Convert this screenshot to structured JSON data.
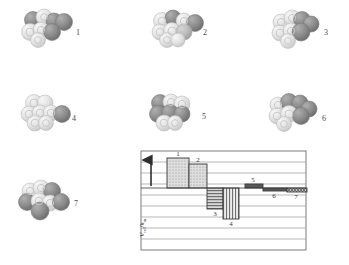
{
  "figure": {
    "type": "scientific-figure"
  },
  "clusters": [
    {
      "id": "1",
      "label": "1",
      "x": 18,
      "y": 8,
      "w": 62,
      "h": 44,
      "label_x": 76,
      "label_y": 29
    },
    {
      "id": "2",
      "label": "2",
      "x": 148,
      "y": 8,
      "w": 62,
      "h": 44,
      "label_x": 203,
      "label_y": 29
    },
    {
      "id": "3",
      "label": "3",
      "x": 268,
      "y": 8,
      "w": 58,
      "h": 44,
      "label_x": 324,
      "label_y": 29
    },
    {
      "id": "4",
      "label": "4",
      "x": 18,
      "y": 92,
      "w": 58,
      "h": 42,
      "label_x": 72,
      "label_y": 115
    },
    {
      "id": "5",
      "label": "5",
      "x": 146,
      "y": 92,
      "w": 58,
      "h": 42,
      "label_x": 202,
      "label_y": 113
    },
    {
      "id": "6",
      "label": "6",
      "x": 265,
      "y": 92,
      "w": 58,
      "h": 42,
      "label_x": 322,
      "label_y": 115
    },
    {
      "id": "7",
      "label": "7",
      "x": 16,
      "y": 178,
      "w": 60,
      "h": 44,
      "label_x": 74,
      "label_y": 200
    }
  ],
  "chart_data": {
    "type": "bar",
    "title": "",
    "xlabel": "",
    "ylabel": "V_rel / k_m",
    "ylabel_main": "V",
    "ylabel_sub1": "rel",
    "ylabel_sep": "/k",
    "ylabel_sub2": "m",
    "categories": [
      "1",
      "2",
      "3",
      "4",
      "5",
      "6",
      "7"
    ],
    "values": [
      3.0,
      2.5,
      -2.1,
      -3.1,
      0.45,
      -0.3,
      -0.35
    ],
    "bar_labels": [
      "1",
      "2",
      "3",
      "4",
      "5",
      "6",
      "7"
    ],
    "ylim": [
      -4.5,
      4.0
    ],
    "gridlines": 9,
    "grid": true,
    "legend": "none",
    "zero_baseline": true,
    "arrow_direction": "up",
    "fills": [
      "dots",
      "dots",
      "horizontal-lines",
      "vertical-lines",
      "solid-dark",
      "solid-dark",
      "crosshatch"
    ]
  },
  "chart_layout": {
    "frame_x": 141,
    "frame_y": 151,
    "frame_w": 165,
    "frame_h": 99,
    "zero_y": 188,
    "bars_px": [
      {
        "label": "1",
        "x": 167,
        "w": 22,
        "top": 158,
        "bottom": 188,
        "fill": "dots",
        "label_x": 178,
        "label_y": 156,
        "label_pos": "above"
      },
      {
        "label": "2",
        "x": 189,
        "w": 18,
        "top": 164,
        "bottom": 188,
        "fill": "dots",
        "label_x": 198,
        "label_y": 162,
        "label_pos": "above"
      },
      {
        "label": "3",
        "x": 207,
        "w": 16,
        "top": 188,
        "bottom": 209,
        "fill": "horizontal-lines",
        "label_x": 215,
        "label_y": 216,
        "label_pos": "below"
      },
      {
        "label": "4",
        "x": 223,
        "w": 16,
        "top": 188,
        "bottom": 219,
        "fill": "vertical-lines",
        "label_x": 231,
        "label_y": 226,
        "label_pos": "below"
      },
      {
        "label": "5",
        "x": 245,
        "w": 18,
        "top": 184,
        "bottom": 188,
        "fill": "solid-dark",
        "label_x": 253,
        "label_y": 182,
        "label_pos": "above"
      },
      {
        "label": "6",
        "x": 263,
        "w": 24,
        "top": 188,
        "bottom": 191,
        "fill": "solid-dark",
        "label_x": 274,
        "label_y": 198,
        "label_pos": "below"
      },
      {
        "label": "7",
        "x": 287,
        "w": 20,
        "top": 188,
        "bottom": 192,
        "fill": "crosshatch",
        "label_x": 296,
        "label_y": 199,
        "label_pos": "below"
      }
    ],
    "arrow": {
      "x": 151,
      "y_top": 160,
      "y_bottom": 186
    }
  },
  "colors": {
    "sphere_light": "#e2e2e2",
    "sphere_light_edge": "#b8b8b8",
    "sphere_dark": "#8e8e8e",
    "sphere_dark_edge": "#6f6f6f",
    "sphere_mid": "#b5b5b5",
    "frame": "#6e6e6e",
    "gridline": "#9a9a9a",
    "bar_stroke": "#3a3a3a",
    "bar_fill_light": "#d9d9d9",
    "bar_fill_dark": "#585858",
    "text": "#3a3a3a",
    "background": "#ffffff"
  }
}
